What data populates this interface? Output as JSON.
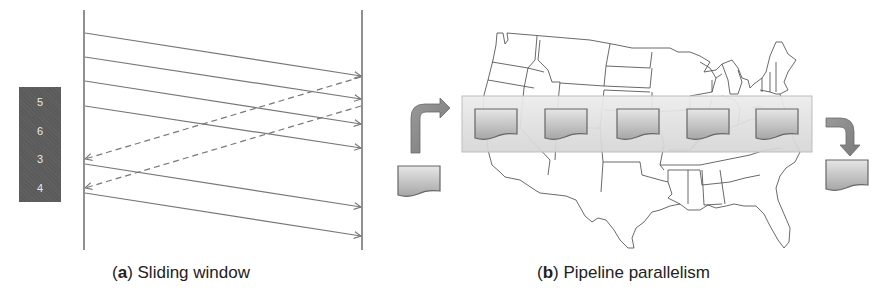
{
  "figure": {
    "panel_a": {
      "caption_letter": "a",
      "caption_text": " Sliding window",
      "window_boxes": [
        {
          "label": "5",
          "top": 87,
          "height": 29
        },
        {
          "label": "6",
          "top": 116,
          "height": 29
        },
        {
          "label": "3",
          "top": 145,
          "height": 28
        },
        {
          "label": "4",
          "top": 173,
          "height": 29
        }
      ],
      "sender_x": 84,
      "receiver_x": 362,
      "timeline_y": [
        10,
        250
      ],
      "messages": [
        {
          "from": "sender",
          "y_start": 33,
          "y_end": 76,
          "style": "solid"
        },
        {
          "from": "sender",
          "y_start": 57,
          "y_end": 99,
          "style": "solid"
        },
        {
          "from": "sender",
          "y_start": 81,
          "y_end": 124,
          "style": "solid"
        },
        {
          "from": "sender",
          "y_start": 106,
          "y_end": 148,
          "style": "solid"
        },
        {
          "from": "receiver",
          "y_start": 77,
          "y_end": 159,
          "style": "dashed"
        },
        {
          "from": "receiver",
          "y_start": 106,
          "y_end": 188,
          "style": "dashed"
        },
        {
          "from": "sender",
          "y_start": 164,
          "y_end": 207,
          "style": "solid"
        },
        {
          "from": "sender",
          "y_start": 193,
          "y_end": 236,
          "style": "solid"
        }
      ]
    },
    "panel_b": {
      "caption_letter": "b",
      "caption_text": " Pipeline parallelism",
      "pipeline_stages": 5,
      "input_label": "input-document",
      "output_label": "output-document",
      "map": "united-states-map"
    },
    "colors": {
      "line": "#555555",
      "arrow": "#777777",
      "window_box": "#5b5b5b",
      "window_text": "#e8e8e8",
      "pipeline_bar": "#e2e2e2",
      "doc_top": "#e4e4e4",
      "doc_bottom": "#a8a8a8",
      "doc_outline": "#666666",
      "curved_arrow": "#8c8c8c"
    }
  }
}
